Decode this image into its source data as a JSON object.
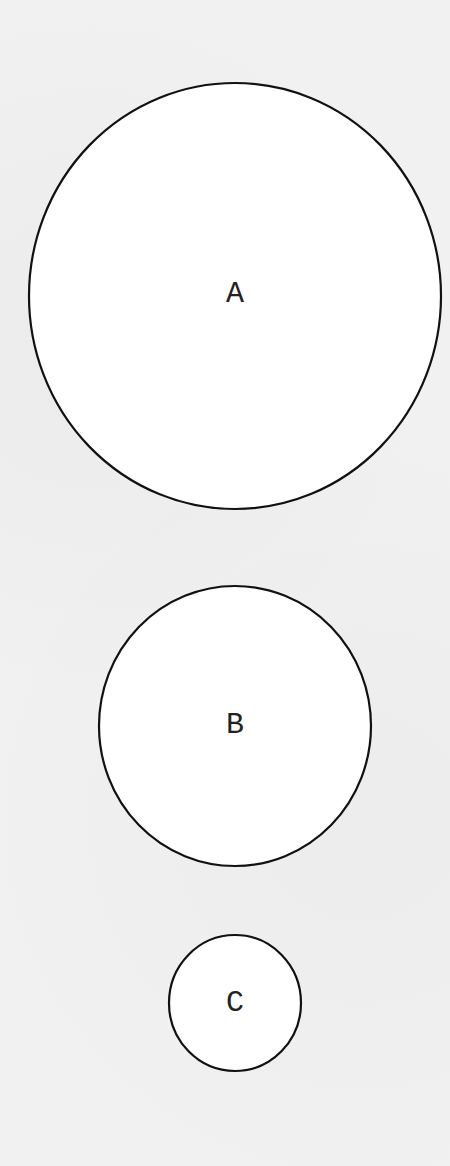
{
  "diagram": {
    "type": "circles",
    "circles": [
      {
        "id": "A",
        "label": "A",
        "relative_size": "large"
      },
      {
        "id": "B",
        "label": "B",
        "relative_size": "medium"
      },
      {
        "id": "C",
        "label": "C",
        "relative_size": "small"
      }
    ],
    "colors": {
      "fill": "#ffffff",
      "stroke": "#111111",
      "background": "#f1f1f1"
    }
  }
}
